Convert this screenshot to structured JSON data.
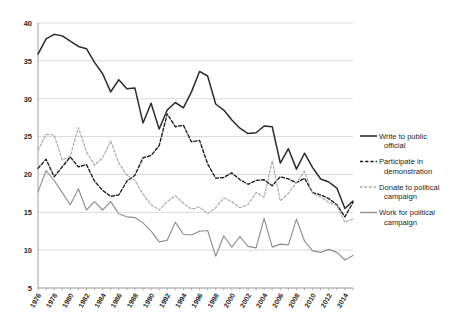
{
  "chart_data": {
    "type": "line",
    "title": "",
    "subtitle": "",
    "xlabel": "",
    "ylabel": "",
    "ylim": [
      5,
      40
    ],
    "yticks": [
      5,
      10,
      15,
      20,
      25,
      30,
      35,
      40
    ],
    "xlim": [
      1976,
      2015
    ],
    "xticks": [
      1976,
      1978,
      1980,
      1982,
      1984,
      1986,
      1988,
      1990,
      1992,
      1994,
      1996,
      1998,
      2000,
      2002,
      2004,
      2006,
      2008,
      2010,
      2012,
      2014
    ],
    "grid": true,
    "legend_position": "right",
    "x": [
      1976,
      1977,
      1978,
      1979,
      1980,
      1981,
      1982,
      1983,
      1984,
      1985,
      1986,
      1987,
      1988,
      1989,
      1990,
      1991,
      1992,
      1993,
      1994,
      1995,
      1996,
      1997,
      1998,
      1999,
      2000,
      2001,
      2002,
      2003,
      2004,
      2005,
      2006,
      2007,
      2008,
      2009,
      2010,
      2011,
      2012,
      2013,
      2014,
      2015
    ],
    "series": [
      {
        "name": "Write to public official",
        "color": "#2b2b2b",
        "style": "solid",
        "values": [
          35.9,
          37.9,
          38.5,
          38.3,
          37.6,
          36.9,
          36.6,
          34.8,
          33.3,
          30.9,
          32.5,
          31.3,
          31.4,
          26.8,
          29.4,
          26.0,
          28.5,
          29.5,
          28.8,
          30.9,
          33.6,
          33.0,
          29.3,
          28.5,
          27.2,
          26.1,
          25.4,
          25.5,
          26.4,
          26.3,
          21.5,
          23.4,
          20.7,
          22.8,
          20.9,
          19.4,
          19.0,
          18.2,
          15.5,
          16.5
        ]
      },
      {
        "name": "Participate in demonstration",
        "color": "#1a1a1a",
        "style": "dashed",
        "values": [
          20.8,
          22.0,
          19.7,
          21.0,
          22.3,
          21.0,
          21.3,
          19.1,
          17.9,
          17.1,
          17.3,
          19.1,
          19.9,
          22.2,
          22.5,
          23.8,
          28.0,
          26.3,
          26.5,
          24.3,
          24.5,
          21.4,
          19.5,
          19.6,
          20.2,
          19.3,
          18.7,
          19.2,
          19.3,
          18.5,
          19.7,
          19.4,
          18.9,
          19.5,
          17.6,
          17.3,
          16.8,
          16.0,
          14.4,
          16.3
        ]
      },
      {
        "name": "Donate to political campaign",
        "color": "#a8a8a8",
        "style": "dashed",
        "values": [
          23.2,
          25.3,
          25.2,
          21.9,
          22.4,
          26.2,
          23.0,
          21.2,
          22.2,
          24.4,
          21.5,
          19.9,
          19.2,
          17.4,
          16.0,
          15.3,
          16.4,
          17.2,
          16.2,
          15.4,
          15.7,
          14.8,
          15.6,
          16.9,
          16.4,
          15.6,
          16.0,
          17.6,
          17.0,
          21.8,
          16.5,
          17.5,
          18.9,
          20.4,
          17.5,
          17.0,
          16.3,
          15.9,
          13.7,
          14.1
        ]
      },
      {
        "name": "Work for political campaign",
        "color": "#8f8f8f",
        "style": "solid",
        "values": [
          17.7,
          20.5,
          19.2,
          17.6,
          16.0,
          18.1,
          15.3,
          16.4,
          15.3,
          16.4,
          14.8,
          14.4,
          14.3,
          13.6,
          12.5,
          11.1,
          11.3,
          13.7,
          12.1,
          12.0,
          12.5,
          12.6,
          9.2,
          11.9,
          10.4,
          11.8,
          10.5,
          10.3,
          14.2,
          10.4,
          10.8,
          10.7,
          14.1,
          11.2,
          9.9,
          9.7,
          10.1,
          9.7,
          8.7,
          9.3
        ]
      }
    ]
  },
  "legend": {
    "items": [
      {
        "label_line1": "Write to public",
        "label_line2": "official"
      },
      {
        "label_line1": "Participate in",
        "label_line2": "demonstration"
      },
      {
        "label_line1": "Donate to political",
        "label_line2": "campaign"
      },
      {
        "label_line1": "Work for political",
        "label_line2": "campaign"
      }
    ]
  }
}
